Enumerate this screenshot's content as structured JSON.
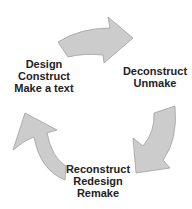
{
  "diagram": {
    "type": "cycle",
    "arrow_fill": "#cccccc",
    "arrow_stroke": "#a0a0a0",
    "text_color": "#222222",
    "stages": [
      {
        "id": "design",
        "lines": [
          "Design",
          "Construct",
          "Make a text"
        ]
      },
      {
        "id": "deconstruct",
        "lines": [
          "Deconstruct",
          "Unmake"
        ]
      },
      {
        "id": "reconstruct",
        "lines": [
          "Reconstruct",
          "Redesign",
          "Remake"
        ]
      }
    ],
    "arrows": [
      {
        "from": "design",
        "to": "deconstruct",
        "direction": "clockwise"
      },
      {
        "from": "deconstruct",
        "to": "reconstruct",
        "direction": "clockwise"
      },
      {
        "from": "reconstruct",
        "to": "design",
        "direction": "clockwise"
      }
    ]
  }
}
